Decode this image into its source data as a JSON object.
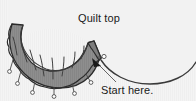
{
  "figure": {
    "name": "quilt-binding-diagram",
    "width": 196,
    "height": 101,
    "background_color": "#ffffff"
  },
  "labels": {
    "quilt_top": "Quilt top",
    "start_here": "Start here."
  },
  "colors": {
    "quilt_fill": "#f2f2f2",
    "quilt_edge": "#3a3a3a",
    "binding_fill": "#8c8c8c",
    "binding_fill_dark": "#7a7a7a",
    "binding_edge": "#2b2b2b",
    "pin_stroke": "#4a4a4a",
    "pin_head": "#ffffff",
    "text": "#1a1a1a",
    "leader_line": "#555555",
    "arrow": "#1a1a1a"
  },
  "elements": {
    "quilt_top_shape_name": "quilt-top-body",
    "binding_strip_name": "binding-strip",
    "pins": [
      {
        "id": "pin-1",
        "x": 13,
        "y": 70
      },
      {
        "id": "pin-2",
        "x": 22,
        "y": 79
      },
      {
        "id": "pin-3",
        "x": 37,
        "y": 85
      },
      {
        "id": "pin-4",
        "x": 56,
        "y": 86
      },
      {
        "id": "pin-5",
        "x": 72,
        "y": 81
      },
      {
        "id": "pin-6",
        "x": 86,
        "y": 70
      },
      {
        "id": "pin-7",
        "x": 95,
        "y": 57
      }
    ],
    "fold_lines_count": 7,
    "arrow_target": {
      "x": 93,
      "y": 59
    },
    "leader_start": {
      "x": 116,
      "y": 82
    }
  }
}
